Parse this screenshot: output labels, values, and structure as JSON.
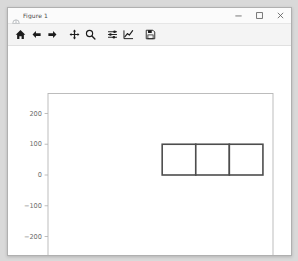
{
  "window": {
    "title": "Figure 1",
    "icon": "matplotlib-figure-icon",
    "controls": {
      "minimize_label": "Minimize",
      "maximize_label": "Maximize",
      "close_label": "Close"
    }
  },
  "toolbar": {
    "buttons": [
      {
        "name": "home-icon",
        "tooltip": "Reset original view"
      },
      {
        "name": "arrow-left-icon",
        "tooltip": "Back to previous view"
      },
      {
        "name": "arrow-right-icon",
        "tooltip": "Forward to next view"
      },
      {
        "name": "move-icon",
        "tooltip": "Pan axes with left mouse, zoom with right"
      },
      {
        "name": "magnifier-icon",
        "tooltip": "Zoom to rectangle"
      },
      {
        "name": "sliders-icon",
        "tooltip": "Configure subplots"
      },
      {
        "name": "chart-line-icon",
        "tooltip": "Edit axis, curve and image parameters"
      },
      {
        "name": "floppy-disk-save-icon",
        "tooltip": "Save the figure"
      }
    ]
  },
  "chart_data": {
    "type": "bar",
    "title": "",
    "xlabel": "",
    "ylabel": "",
    "xlim": [
      -340,
      330
    ],
    "ylim": [
      -265,
      265
    ],
    "xticks": [
      -300,
      -200,
      -100,
      0,
      100,
      200,
      300
    ],
    "xticklabels": [
      "-300",
      "-200",
      "-100",
      "0",
      "100",
      "200",
      "300"
    ],
    "yticks": [
      -200,
      -100,
      0,
      100,
      200
    ],
    "yticklabels": [
      "-200",
      "-100",
      "0",
      "100",
      "200"
    ],
    "grid": false,
    "legend": null,
    "edgecolor": "#4d4d4d",
    "facecolor": "#ffffff",
    "linewidth": 1.6,
    "rectangles": [
      {
        "x": 0,
        "y": 0,
        "width": 100,
        "height": 100
      },
      {
        "x": 100,
        "y": 0,
        "width": 100,
        "height": 100
      },
      {
        "x": 200,
        "y": 0,
        "width": 100,
        "height": 100
      }
    ],
    "categories": [
      "0-100",
      "100-200",
      "200-300"
    ],
    "values": [
      100,
      100,
      100
    ]
  }
}
